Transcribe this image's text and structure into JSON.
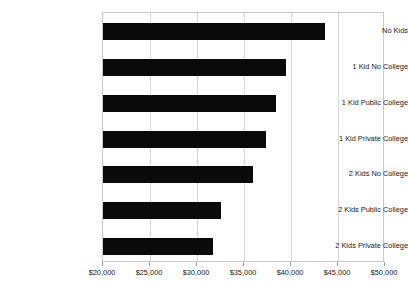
{
  "chart_data": {
    "type": "bar",
    "orientation": "horizontal",
    "title": "",
    "subtitle": "",
    "xlabel": "",
    "ylabel": "",
    "categories": [
      "No Kids",
      "1 Kid No College",
      "1 Kid Public College",
      "1 Kid Private College",
      "2 Kids No College",
      "2 Kids Public College",
      "2 Kids Private College"
    ],
    "values": [
      43600,
      39450,
      38400,
      37350,
      35950,
      32550,
      31700
    ],
    "xlim": [
      20000,
      50000
    ],
    "xticks": [
      20000,
      25000,
      30000,
      35000,
      40000,
      45000,
      50000
    ],
    "xtick_labels": [
      "$20,000",
      "$25,000",
      "$30,000",
      "$35,000",
      "$40,000",
      "$45,000",
      "$50,000"
    ],
    "grid": "vertical",
    "legend": "none",
    "bar_color": "#0a0a0a",
    "grid_color": "#d8d8d8",
    "frame_color": "#c8c8c8",
    "background_color": "#ffffff"
  }
}
